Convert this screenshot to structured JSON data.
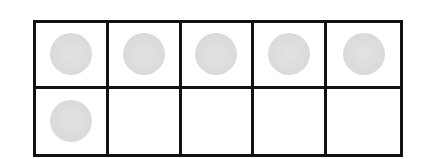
{
  "ten_frame": {
    "rows": 2,
    "columns": 5,
    "filled_count": 6,
    "cells": [
      {
        "filled": true
      },
      {
        "filled": true
      },
      {
        "filled": true
      },
      {
        "filled": true
      },
      {
        "filled": true
      },
      {
        "filled": true
      },
      {
        "filled": false
      },
      {
        "filled": false
      },
      {
        "filled": false
      },
      {
        "filled": false
      }
    ],
    "counter_color": "#dadada",
    "border_color": "#111111"
  }
}
